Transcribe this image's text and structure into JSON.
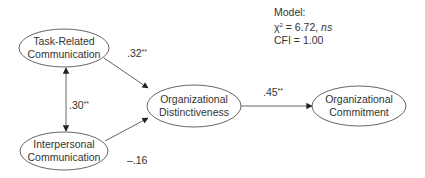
{
  "diagram": {
    "type": "path-model",
    "model_stats": {
      "heading": "Model:",
      "chi_symbol": "χ",
      "chi_sup": "2",
      "chi_value": " = 6.72, ",
      "chi_sig": "ns",
      "cfi": "CFI = 1.00"
    },
    "nodes": {
      "task": {
        "line1": "Task-Related",
        "line2": "Communication"
      },
      "interpersonal": {
        "line1": "Interpersonal",
        "line2": "Communication"
      },
      "distinctiveness": {
        "line1": "Organizational",
        "line2": "Distinctiveness"
      },
      "commitment": {
        "line1": "Organizational",
        "line2": "Commitment"
      }
    },
    "edges": {
      "task_to_distinct": {
        "value": ".32",
        "sig": "**"
      },
      "task_interpersonal_corr": {
        "value": ".30",
        "sig": "**"
      },
      "interpersonal_to_distinct": {
        "value": "–.16",
        "sig": ""
      },
      "distinct_to_commit": {
        "value": ".45",
        "sig": "**"
      }
    },
    "colors": {
      "stroke": "#4a4a4a",
      "text": "#333333"
    }
  }
}
